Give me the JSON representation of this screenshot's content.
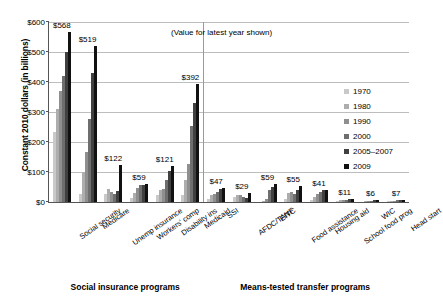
{
  "chart_data": {
    "type": "bar",
    "title": "",
    "annotation": "(Value for latest year shown)",
    "xlabel": "",
    "ylabel": "Constant 2010 dollars (in billions)",
    "ylim": [
      0,
      600
    ],
    "ytick_labels": [
      "$0",
      "$100",
      "$200",
      "$300",
      "$400",
      "$500",
      "$600"
    ],
    "ytick_values": [
      0,
      100,
      200,
      300,
      400,
      500,
      600
    ],
    "grid": true,
    "legend_position": "right",
    "legend": [
      "1970",
      "1980",
      "1990",
      "2000",
      "2005–2007",
      "2009"
    ],
    "series_colors": [
      "#c9c9c9",
      "#adadad",
      "#8f8f8f",
      "#6e6e6e",
      "#404040",
      "#111111"
    ],
    "categories": [
      "Social security",
      "Medicare",
      "Unemp insurance",
      "Workers' comp",
      "Disability ins",
      "Medicaid",
      "SSI",
      "AFDC/TANF",
      "EITC",
      "Food assistance",
      "Housing aid",
      "School food prog",
      "WIC",
      "Head start"
    ],
    "latest_value_labels": [
      "$568",
      "$519",
      "$122",
      "$59",
      "$121",
      "$392",
      "$47",
      "$29",
      "$59",
      "$55",
      "$41",
      "$11",
      "$6",
      "$7"
    ],
    "series": [
      {
        "name": "1970",
        "values": [
          232,
          28,
          26,
          12,
          22,
          22,
          11,
          18,
          0,
          9,
          7,
          2,
          0,
          1
        ]
      },
      {
        "name": "1980",
        "values": [
          310,
          100,
          45,
          30,
          40,
          72,
          24,
          24,
          4,
          30,
          17,
          6,
          2,
          2
        ]
      },
      {
        "name": "1990",
        "values": [
          370,
          168,
          32,
          48,
          44,
          128,
          28,
          23,
          10,
          32,
          26,
          6,
          3,
          3
        ]
      },
      {
        "name": "2000",
        "values": [
          420,
          278,
          26,
          57,
          72,
          252,
          35,
          16,
          40,
          27,
          33,
          8,
          5,
          7
        ]
      },
      {
        "name": "2005–2007",
        "values": [
          500,
          430,
          36,
          58,
          105,
          330,
          43,
          14,
          49,
          41,
          39,
          10,
          6,
          8
        ]
      },
      {
        "name": "2009",
        "values": [
          568,
          519,
          122,
          59,
          121,
          392,
          47,
          29,
          59,
          55,
          41,
          11,
          6,
          7
        ]
      }
    ],
    "sections": [
      {
        "label": "Social insurance programs",
        "categories": 6
      },
      {
        "label": "Means-tested transfer programs",
        "categories": 8
      }
    ]
  }
}
